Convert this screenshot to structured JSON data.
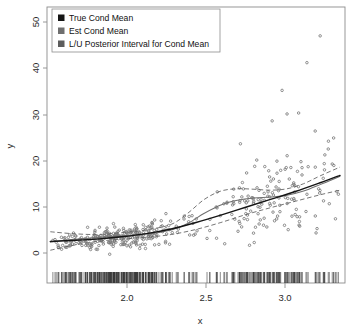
{
  "figure": {
    "background": "#ffffff",
    "frame_color": "#8c8c8c",
    "width": 362,
    "height": 336
  },
  "legend": {
    "position": "top-left",
    "boxed": true,
    "entries": [
      {
        "label": "True Cond Mean",
        "color": "#151515",
        "marker": "square"
      },
      {
        "label": "Est Cond Mean",
        "color": "#6f6f6f",
        "marker": "square"
      },
      {
        "label": "L/U Posterior Interval for Cond Mean",
        "color": "#5d5d5d",
        "marker": "square"
      }
    ]
  },
  "axes": {
    "x_label": "x",
    "y_label": "y",
    "x_ticks": [
      "2.0",
      "2.5",
      "3.0"
    ],
    "y_ticks": [
      "0",
      "10",
      "20",
      "30",
      "40",
      "50"
    ]
  },
  "chart_data": {
    "type": "scatter",
    "title": "",
    "xlabel": "x",
    "ylabel": "y",
    "xlim": [
      1.6,
      3.4
    ],
    "ylim": [
      -2,
      52
    ],
    "x_ticks": [
      2.0,
      2.5,
      3.0
    ],
    "y_ticks": [
      0,
      10,
      20,
      30,
      40,
      50
    ],
    "grid": false,
    "legend_position": "top-left",
    "legend_entries": [
      "True Cond Mean",
      "Est Cond Mean",
      "L/U Posterior Interval for Cond Mean"
    ],
    "annotations": [
      "rug plot of x values along bottom margin"
    ],
    "series": [
      {
        "name": "True Cond Mean",
        "type": "line",
        "style": "solid",
        "color": "#151515",
        "x": [
          1.62,
          1.75,
          1.9,
          2.05,
          2.2,
          2.35,
          2.5,
          2.65,
          2.8,
          2.95,
          3.1,
          3.25,
          3.37
        ],
        "values": [
          2.5,
          2.7,
          3.0,
          3.5,
          4.2,
          5.2,
          6.6,
          8.2,
          9.9,
          11.6,
          13.3,
          15.2,
          16.8
        ]
      },
      {
        "name": "Est Cond Mean",
        "type": "line",
        "style": "solid",
        "color": "#6f6f6f",
        "x": [
          1.62,
          1.75,
          1.9,
          2.05,
          2.2,
          2.35,
          2.45,
          2.55,
          2.65,
          2.75,
          2.85,
          2.95,
          3.05,
          3.15,
          3.25,
          3.37
        ],
        "values": [
          2.4,
          2.9,
          3.3,
          3.7,
          4.1,
          5.0,
          6.4,
          8.6,
          10.4,
          11.4,
          11.9,
          12.1,
          12.5,
          13.4,
          14.8,
          16.6
        ]
      },
      {
        "name": "Lower Posterior Interval",
        "type": "line",
        "style": "dashed",
        "color": "#5d5d5d",
        "x": [
          1.62,
          1.75,
          1.9,
          2.05,
          2.2,
          2.35,
          2.5,
          2.65,
          2.8,
          2.95,
          3.1,
          3.25,
          3.37
        ],
        "values": [
          0.6,
          1.6,
          2.5,
          3.0,
          3.4,
          4.0,
          5.1,
          6.6,
          8.3,
          9.8,
          11.2,
          12.6,
          13.6
        ]
      },
      {
        "name": "Upper Posterior Interval",
        "type": "line",
        "style": "dashed",
        "color": "#5d5d5d",
        "x": [
          1.62,
          1.75,
          1.9,
          2.05,
          2.2,
          2.35,
          2.45,
          2.55,
          2.65,
          2.75,
          2.85,
          2.95,
          3.05,
          3.15,
          3.25,
          3.37
        ],
        "values": [
          4.6,
          4.2,
          4.0,
          4.4,
          5.0,
          6.2,
          8.6,
          11.6,
          13.4,
          13.9,
          13.8,
          13.6,
          13.9,
          15.0,
          16.7,
          18.6
        ]
      },
      {
        "name": "observations",
        "type": "scatter",
        "color": "#7b7b7b",
        "marker": "circle",
        "n_points": 420,
        "note": "heteroscedastic cloud; spread widens with x, outliers up to y=47 near x=3.25"
      }
    ]
  }
}
